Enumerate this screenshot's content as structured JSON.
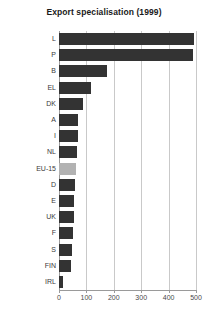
{
  "chart_data": {
    "type": "bar",
    "orientation": "horizontal",
    "title": "Export specialisation (1999)",
    "xlabel": "",
    "ylabel": "",
    "categories": [
      "L",
      "P",
      "B",
      "EL",
      "DK",
      "A",
      "I",
      "NL",
      "EU-15",
      "D",
      "E",
      "UK",
      "F",
      "S",
      "FIN",
      "IRL"
    ],
    "values": [
      492,
      490,
      176,
      115,
      86,
      70,
      69,
      64,
      62,
      58,
      55,
      53,
      50,
      48,
      45,
      16
    ],
    "highlight_category": "EU-15",
    "xlim": [
      0,
      500
    ],
    "xticks": [
      0,
      100,
      200,
      300,
      400,
      500
    ],
    "xtick_labels": [
      "0",
      "100",
      "200",
      "300",
      "400",
      "500"
    ],
    "grid": "vertical",
    "legend": null,
    "bar_color": "#333333",
    "highlight_color": "#b2b2b2",
    "grid_color": "#c9c9c9",
    "axis_color": "#9a9a9a"
  }
}
